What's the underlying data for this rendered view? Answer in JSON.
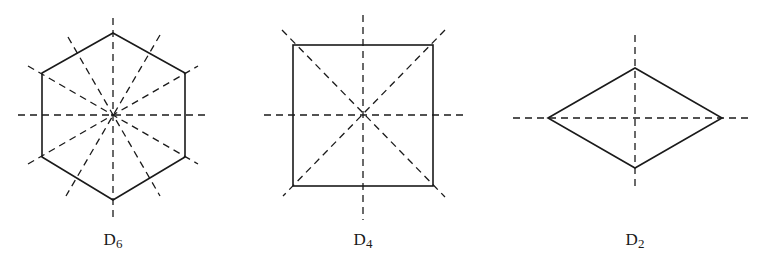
{
  "figures": [
    {
      "id": "hexagon",
      "label_main": "D",
      "label_sub": "6",
      "shape": "regular hexagon",
      "symmetry_axes": 6,
      "center": [
        113,
        115
      ],
      "vertices": [
        [
          113,
          33
        ],
        [
          185,
          73
        ],
        [
          185,
          157
        ],
        [
          113,
          200
        ],
        [
          42,
          157
        ],
        [
          42,
          73
        ]
      ],
      "label_pos": [
        113,
        238
      ]
    },
    {
      "id": "square",
      "label_main": "D",
      "label_sub": "4",
      "shape": "square",
      "symmetry_axes": 4,
      "center": [
        363,
        115
      ],
      "vertices": [
        [
          293,
          45
        ],
        [
          433,
          45
        ],
        [
          433,
          186
        ],
        [
          293,
          186
        ]
      ],
      "label_pos": [
        363,
        238
      ]
    },
    {
      "id": "rhombus",
      "label_main": "D",
      "label_sub": "2",
      "shape": "rhombus",
      "symmetry_axes": 2,
      "center": [
        635,
        118
      ],
      "vertices": [
        [
          548,
          118
        ],
        [
          635,
          68
        ],
        [
          722,
          118
        ],
        [
          635,
          168
        ]
      ],
      "label_pos": [
        635,
        238
      ]
    }
  ],
  "style": {
    "stroke": "#1a1a1a",
    "dash": "7 5"
  }
}
